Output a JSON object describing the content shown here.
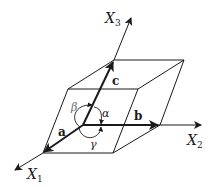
{
  "diagram": {
    "type": "unit-cell-parallelepiped",
    "axes": [
      {
        "id": "x1",
        "label": "X",
        "subscript": "1"
      },
      {
        "id": "x2",
        "label": "X",
        "subscript": "2"
      },
      {
        "id": "x3",
        "label": "X",
        "subscript": "3"
      }
    ],
    "vectors": [
      {
        "id": "a",
        "label": "a"
      },
      {
        "id": "b",
        "label": "b"
      },
      {
        "id": "c",
        "label": "c"
      }
    ],
    "angles": [
      {
        "id": "alpha",
        "label": "α"
      },
      {
        "id": "beta",
        "label": "β"
      },
      {
        "id": "gamma",
        "label": "γ"
      }
    ],
    "colors": {
      "line": "#1a1a1a",
      "background": "#ffffff"
    }
  }
}
